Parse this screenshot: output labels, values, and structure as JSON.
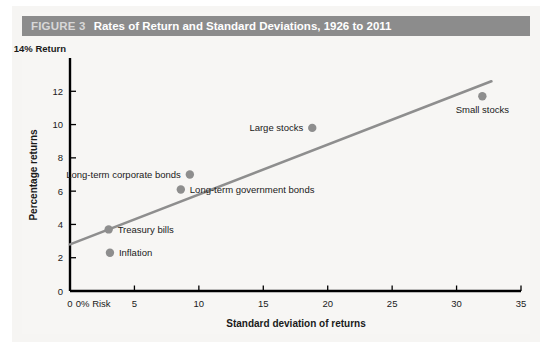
{
  "figure": {
    "number_label": "FIGURE 3",
    "title": "Rates of Return and Standard Deviations, 1926 to 2011",
    "header_bg": "#8c8c8c",
    "header_number_color": "#d8d8d8",
    "header_title_color": "#ffffff"
  },
  "chart_data": {
    "type": "scatter",
    "title": "Rates of Return and Standard Deviations, 1926 to 2011",
    "subtitle": "",
    "xlabel": "Standard deviation of returns",
    "ylabel": "Percentage returns",
    "y_axis_top_label": "14% Return",
    "x_origin_annotation": "0% Risk",
    "x_origin_annotation_value": 1.8,
    "xlim": [
      0,
      35
    ],
    "ylim": [
      0,
      14
    ],
    "xticks": [
      0,
      5,
      10,
      15,
      20,
      25,
      30,
      35
    ],
    "xticklabels": [
      "0",
      "5",
      "10",
      "15",
      "20",
      "25",
      "30",
      "35"
    ],
    "yticks": [
      0,
      2,
      4,
      6,
      8,
      10,
      12,
      14
    ],
    "yticklabels": [
      "0",
      "2",
      "4",
      "6",
      "8",
      "10",
      "12",
      "14"
    ],
    "grid": false,
    "legend_position": "none",
    "point_color": "#8e8e8e",
    "line_color": "#8e8e8e",
    "axis_color": "#000000",
    "points": [
      {
        "name": "Inflation",
        "x": 3.1,
        "y": 2.3,
        "label": "Inflation",
        "label_side": "right"
      },
      {
        "name": "Treasury bills",
        "x": 3.0,
        "y": 3.7,
        "label": "Treasury bills",
        "label_side": "right"
      },
      {
        "name": "Long-term government bonds",
        "x": 8.6,
        "y": 6.1,
        "label": "Long-term government bonds",
        "label_side": "right"
      },
      {
        "name": "Long-term corporate bonds",
        "x": 9.3,
        "y": 7.0,
        "label": "Long-term corporate bonds",
        "label_side": "left"
      },
      {
        "name": "Large stocks",
        "x": 18.8,
        "y": 9.8,
        "label": "Large stocks",
        "label_side": "left"
      },
      {
        "name": "Small stocks",
        "x": 32.0,
        "y": 11.7,
        "label": "Small stocks",
        "label_side": "below"
      }
    ],
    "trendline": {
      "name": "security market line",
      "x_start": 0.0,
      "y_start": 2.8,
      "x_end": 32.7,
      "y_end": 12.6
    }
  }
}
